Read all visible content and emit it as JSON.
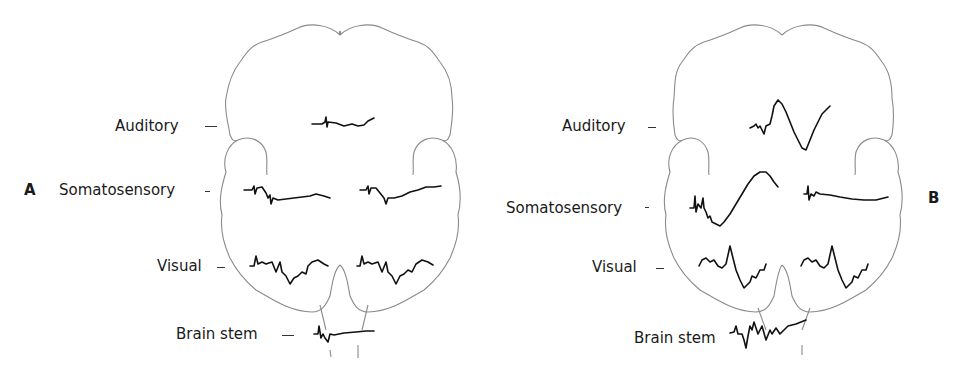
{
  "figure": {
    "panels": [
      {
        "id": "A",
        "letter": "A",
        "labels": {
          "auditory": "Auditory",
          "somatosensory": "Somatosensory",
          "visual": "Visual",
          "brain_stem": "Brain stem"
        }
      },
      {
        "id": "B",
        "letter": "B",
        "labels": {
          "auditory": "Auditory",
          "somatosensory": "Somatosensory",
          "visual": "Visual",
          "brain_stem": "Brain stem"
        }
      }
    ],
    "colors": {
      "outline": "#8a8a8a",
      "trace": "#111111",
      "text": "#1a1a1a",
      "background": "#ffffff"
    }
  }
}
